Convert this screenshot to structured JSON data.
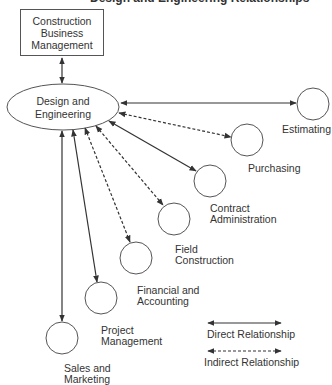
{
  "diagram": {
    "title_partial": "Design and Engineering Relationships",
    "top_box": {
      "label": "Construction\nBusiness\nManagement"
    },
    "center_node": {
      "label": "Design and\nEngineering"
    },
    "nodes": [
      {
        "id": "estimating",
        "label": "Estimating",
        "relationship": "direct"
      },
      {
        "id": "purchasing",
        "label": "Purchasing",
        "relationship": "indirect"
      },
      {
        "id": "contract-administration",
        "label": "Contract\nAdministration",
        "label_line1": "Contract",
        "label_line2": "Administration",
        "relationship": "direct"
      },
      {
        "id": "field-construction",
        "label": "Field\nConstruction",
        "label_line1": "Field",
        "label_line2": "Construction",
        "relationship": "indirect"
      },
      {
        "id": "financial-and-accounting",
        "label": "Financial and\nAccounting",
        "label_line1": "Financial and",
        "label_line2": "Accounting",
        "relationship": "indirect"
      },
      {
        "id": "project-management",
        "label": "Project\nManagement",
        "label_line1": "Project",
        "label_line2": "Management",
        "relationship": "direct"
      },
      {
        "id": "sales-and-marketing",
        "label": "Sales and\nMarketing",
        "label_line1": "Sales and",
        "label_line2": "Marketing",
        "relationship": "direct"
      }
    ],
    "edges": [
      {
        "from": "construction-business-management",
        "to": "design-and-engineering",
        "type": "direct"
      },
      {
        "from": "design-and-engineering",
        "to": "estimating",
        "type": "direct"
      },
      {
        "from": "design-and-engineering",
        "to": "purchasing",
        "type": "indirect"
      },
      {
        "from": "design-and-engineering",
        "to": "contract-administration",
        "type": "direct"
      },
      {
        "from": "design-and-engineering",
        "to": "field-construction",
        "type": "indirect"
      },
      {
        "from": "design-and-engineering",
        "to": "financial-and-accounting",
        "type": "indirect"
      },
      {
        "from": "design-and-engineering",
        "to": "project-management",
        "type": "direct"
      },
      {
        "from": "design-and-engineering",
        "to": "sales-and-marketing",
        "type": "direct"
      }
    ],
    "legend": {
      "direct": "Direct Relationship",
      "indirect": "Indirect Relationship"
    },
    "colors": {
      "line": "#333333",
      "background": "#ffffff"
    }
  }
}
